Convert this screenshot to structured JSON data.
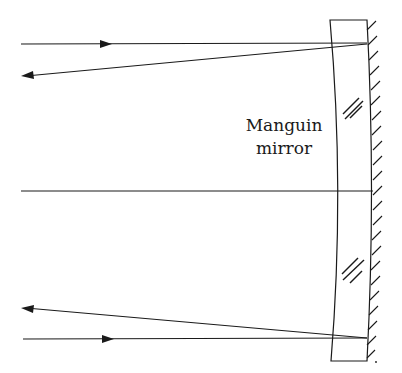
{
  "diagram": {
    "label": {
      "line1": "Manguin",
      "line2": "mirror"
    },
    "colors": {
      "stroke": "#1a1a1a",
      "background": "#ffffff"
    },
    "rays": [
      {
        "name": "top-incident-ray",
        "direction": "right"
      },
      {
        "name": "top-reflected-ray",
        "direction": "left"
      },
      {
        "name": "optical-axis"
      },
      {
        "name": "bottom-reflected-ray",
        "direction": "left"
      },
      {
        "name": "bottom-incident-ray",
        "direction": "right"
      }
    ],
    "elements": [
      "glass-lens",
      "mirror-surface",
      "hatching",
      "glass-marks"
    ]
  }
}
